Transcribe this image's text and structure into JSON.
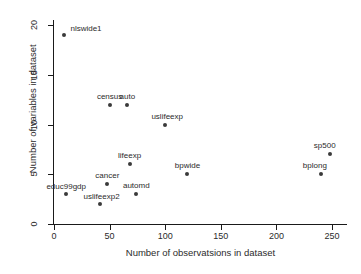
{
  "chart_data": {
    "type": "scatter",
    "title": "",
    "xlabel": "Number of observatsions in dataset",
    "ylabel": "Number of variables in dataset",
    "xlim": [
      0,
      260
    ],
    "ylim": [
      0,
      20.5
    ],
    "xticks": [
      0,
      50,
      100,
      150,
      200,
      250
    ],
    "yticks": [
      0,
      5,
      10,
      15,
      20
    ],
    "grid": false,
    "legend": null,
    "marker_color": "#3a3a3a",
    "axis_color": "#1a1a1a",
    "background": "#ffffff",
    "points": [
      {
        "label": "nlswide1",
        "x": 9,
        "y": 19,
        "label_dx": 22,
        "label_dy": -10
      },
      {
        "label": "census",
        "x": 50,
        "y": 12,
        "label_dx": 0,
        "label_dy": -12
      },
      {
        "label": "auto",
        "x": 66,
        "y": 12,
        "label_dx": 0,
        "label_dy": -12
      },
      {
        "label": "uslifeexp",
        "x": 100,
        "y": 10,
        "label_dx": 2,
        "label_dy": -12
      },
      {
        "label": "lifeexp",
        "x": 68,
        "y": 6,
        "label_dx": 0,
        "label_dy": -12
      },
      {
        "label": "cancer",
        "x": 48,
        "y": 4,
        "label_dx": 0,
        "label_dy": -12
      },
      {
        "label": "educ99gdp",
        "x": 11,
        "y": 3,
        "label_dx": 0,
        "label_dy": -11
      },
      {
        "label": "uslifeexp2",
        "x": 41,
        "y": 2,
        "label_dx": 2,
        "label_dy": -11
      },
      {
        "label": "automd",
        "x": 74,
        "y": 3,
        "label_dx": 0,
        "label_dy": -12
      },
      {
        "label": "bpwide",
        "x": 120,
        "y": 5,
        "label_dx": 0,
        "label_dy": -12
      },
      {
        "label": "sp500",
        "x": 248,
        "y": 7,
        "label_dx": -5,
        "label_dy": -12
      },
      {
        "label": "bplong",
        "x": 240,
        "y": 5,
        "label_dx": -6,
        "label_dy": -12
      }
    ]
  }
}
